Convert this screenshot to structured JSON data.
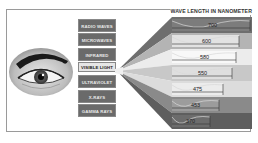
{
  "title": "WAVE LENGTH IN NANOMETER",
  "spectrum_labels": [
    {
      "label": "RADIO WAVES"
    },
    {
      "label": "MICROWAVES"
    },
    {
      "label": "INFRARED"
    },
    {
      "label": "VISIBLE LIGHT"
    },
    {
      "label": "ULTRAVIOLET"
    },
    {
      "label": "X-RAYS"
    },
    {
      "label": "GAMMA RAYS"
    }
  ],
  "wavelengths": [
    {
      "value": "700",
      "color": "#6e6e6e"
    },
    {
      "value": "600",
      "color": "#b4b4b4"
    },
    {
      "value": "580",
      "color": "#ececec"
    },
    {
      "value": "550",
      "color": "#c8c8c8"
    },
    {
      "value": "475",
      "color": "#dcdcdc"
    },
    {
      "value": "453",
      "color": "#8a8a8a"
    },
    {
      "value": "370",
      "color": "#5e5e5e"
    }
  ],
  "icons": {
    "eye": "eye-icon"
  }
}
